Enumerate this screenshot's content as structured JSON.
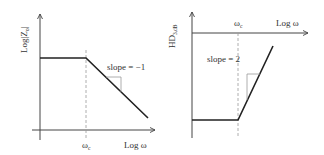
{
  "left_plot": {
    "y_label": "Log|Z",
    "y_label_sub": "o",
    "y_label_end": "|",
    "x_label": "Log ω",
    "corner_label": "ω",
    "corner_label_sub": "c",
    "slope_label": "slope = −1"
  },
  "right_plot": {
    "y_label": "HD",
    "y_label_sub": "3,dB",
    "x_label": "Log ω",
    "corner_label": "ω",
    "corner_label_sub": "c",
    "slope_label": "slope = 2"
  },
  "colors": {
    "axis": "#444444",
    "curve": "#222222",
    "dashed": "#999999",
    "triangle": "#999999",
    "text": "#333333"
  }
}
